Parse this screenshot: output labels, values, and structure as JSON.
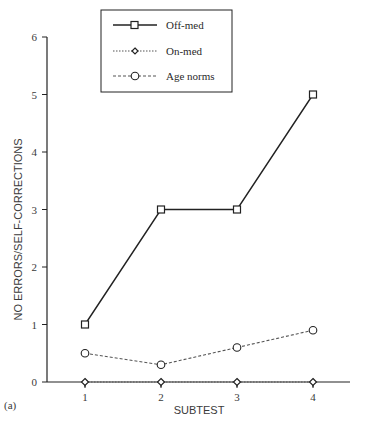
{
  "chart_data": {
    "type": "line",
    "title": "",
    "panel_label": "(a)",
    "xlabel": "SUBTEST",
    "ylabel": "NO ERRORS/SELF-CORRECTIONS",
    "x": [
      1,
      2,
      3,
      4
    ],
    "categories": [
      "1",
      "2",
      "3",
      "4"
    ],
    "ylim": [
      0,
      6
    ],
    "yticks": [
      0,
      1,
      2,
      3,
      4,
      5,
      6
    ],
    "grid": false,
    "legend_position": "top-center",
    "series": [
      {
        "name": "Off-med",
        "values": [
          1,
          3,
          3,
          5
        ],
        "line": "solid",
        "marker": "square"
      },
      {
        "name": "On-med",
        "values": [
          0,
          0,
          0,
          0
        ],
        "line": "dotted",
        "marker": "diamond"
      },
      {
        "name": "Age norms",
        "values": [
          0.5,
          0.3,
          0.6,
          0.9
        ],
        "line": "dashed",
        "marker": "circle"
      }
    ]
  },
  "colors": {
    "line": "#222222",
    "text": "#3a3a3a",
    "background": "#ffffff"
  }
}
